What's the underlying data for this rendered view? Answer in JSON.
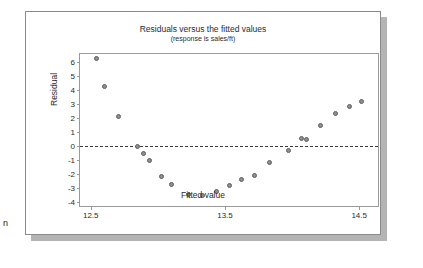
{
  "page_fragment": "n",
  "chart_data": {
    "type": "scatter",
    "title": "Residuals versus the fitted values",
    "subtitle": "(response is sales/ft)",
    "xlabel": "Fitted value",
    "ylabel": "Residual",
    "xlim": [
      12.42,
      14.64
    ],
    "ylim": [
      -4.3,
      6.6
    ],
    "xticks": [
      12.5,
      13.5,
      14.5
    ],
    "xtick_labels": [
      "12.5",
      "13.5",
      "14.5"
    ],
    "yticks": [
      6,
      5,
      4,
      3,
      2,
      1,
      0,
      -1,
      -2,
      -3,
      -4
    ],
    "ytick_labels": [
      "6",
      "5",
      "4",
      "3",
      "2",
      "1",
      "0",
      "-1",
      "-2",
      "-3",
      "-4"
    ],
    "grid": false,
    "legend": null,
    "reference_line": {
      "y": 0,
      "style": "dashed"
    },
    "marker": {
      "shape": "circle",
      "fill": "#8f8f8f",
      "edge": "#5e5e5e",
      "size": 5
    },
    "points": [
      {
        "x": 12.54,
        "y": 6.3
      },
      {
        "x": 12.6,
        "y": 4.3
      },
      {
        "x": 12.71,
        "y": 2.1
      },
      {
        "x": 12.85,
        "y": 0.0
      },
      {
        "x": 12.89,
        "y": -0.55
      },
      {
        "x": 12.94,
        "y": -1.05
      },
      {
        "x": 13.03,
        "y": -2.15
      },
      {
        "x": 13.1,
        "y": -2.75
      },
      {
        "x": 13.23,
        "y": -3.45
      },
      {
        "x": 13.33,
        "y": -3.55
      },
      {
        "x": 13.44,
        "y": -3.25
      },
      {
        "x": 13.53,
        "y": -2.85
      },
      {
        "x": 13.62,
        "y": -2.4
      },
      {
        "x": 13.72,
        "y": -2.1
      },
      {
        "x": 13.83,
        "y": -1.2
      },
      {
        "x": 13.97,
        "y": -0.35
      },
      {
        "x": 14.07,
        "y": 0.55
      },
      {
        "x": 14.11,
        "y": 0.5
      },
      {
        "x": 14.21,
        "y": 1.45
      },
      {
        "x": 14.32,
        "y": 2.35
      },
      {
        "x": 14.43,
        "y": 2.8
      },
      {
        "x": 14.52,
        "y": 3.2
      }
    ]
  }
}
